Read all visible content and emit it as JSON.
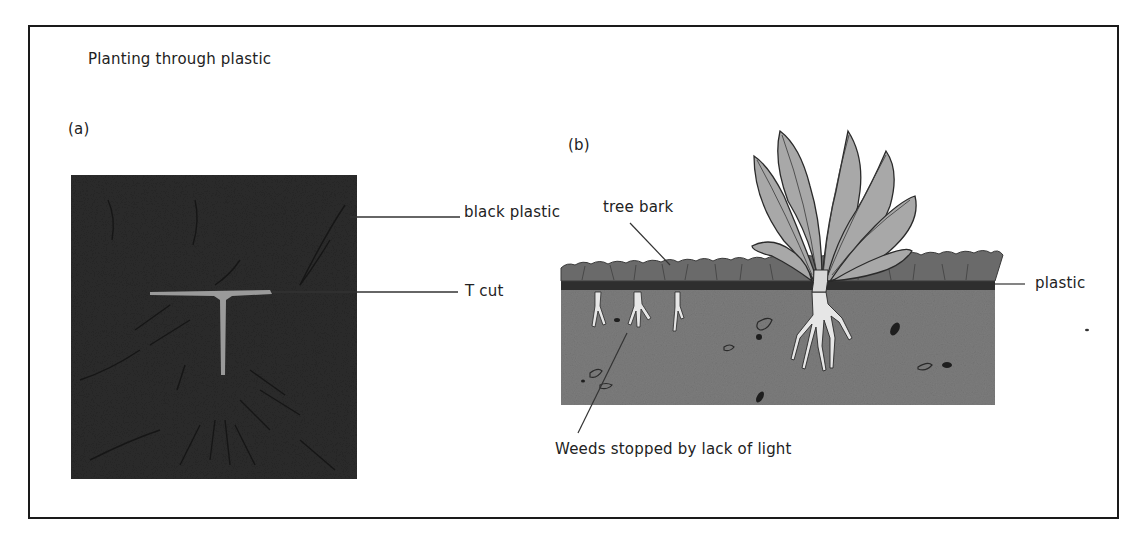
{
  "figure": {
    "title": "Planting through plastic",
    "panel_a": {
      "label": "(a)",
      "callouts": {
        "black_plastic": "black plastic",
        "t_cut": "T cut"
      }
    },
    "panel_b": {
      "label": "(b)",
      "callouts": {
        "tree_bark": "tree bark",
        "plastic": "plastic",
        "weeds": "Weeds stopped by lack of light"
      }
    }
  },
  "colors": {
    "border": "#1a1a1a",
    "black_plastic": "#2b2b2b",
    "t_cut": "#9a9a9a",
    "bark": "#6a6a6a",
    "plastic_layer": "#2e2e2e",
    "soil": "#7d7d7d",
    "leaf": "#a8a8a8",
    "root": "#e6e6e6"
  }
}
